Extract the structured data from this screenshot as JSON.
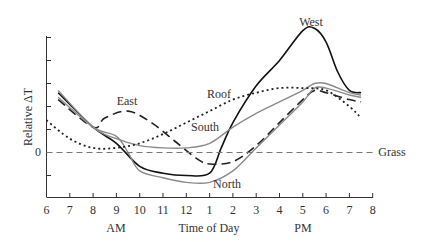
{
  "chart_data": {
    "type": "line",
    "title": "",
    "xlabel": "Time of Day",
    "ylabel": "Relative ΔT",
    "x_ticks": [
      "6",
      "7",
      "8",
      "9",
      "10",
      "11",
      "12",
      "1",
      "2",
      "3",
      "4",
      "5",
      "6",
      "7",
      "8"
    ],
    "x_period_labels": {
      "am": "AM",
      "pm": "PM"
    },
    "y_tick_label_zero": "0",
    "x_range_hours": [
      6,
      20
    ],
    "y_range": [
      -2,
      5
    ],
    "grid": false,
    "legend": "inline curve labels",
    "series": [
      {
        "name": "West",
        "style": "solid-black",
        "x": [
          6.5,
          8,
          9,
          10,
          11,
          12,
          13,
          13.5,
          14,
          15,
          16,
          17,
          17.5,
          18,
          18.5,
          19,
          19.5
        ],
        "y": [
          2.6,
          1.1,
          0.4,
          -0.6,
          -0.9,
          -1.0,
          -0.9,
          0.2,
          1.3,
          2.9,
          4.0,
          5.3,
          5.4,
          4.8,
          3.5,
          2.7,
          2.6
        ]
      },
      {
        "name": "East",
        "style": "long-dash-black",
        "x": [
          6.5,
          8,
          8.5,
          9.5,
          10.5,
          11.5,
          12.5,
          13,
          14,
          15,
          16,
          17,
          17.5,
          18,
          19,
          19.5
        ],
        "y": [
          2.3,
          1.1,
          1.5,
          1.8,
          1.3,
          0.5,
          -0.3,
          -0.5,
          -0.4,
          0.3,
          1.3,
          2.3,
          2.7,
          2.6,
          2.3,
          2.2
        ]
      },
      {
        "name": "South",
        "style": "solid-gray",
        "x": [
          6.5,
          8,
          9,
          10,
          11,
          12,
          13,
          14,
          15,
          16,
          17,
          17.5,
          18,
          19,
          19.5
        ],
        "y": [
          2.7,
          1.1,
          0.6,
          0.3,
          0.2,
          0.2,
          0.4,
          1.1,
          1.7,
          2.2,
          2.7,
          3.0,
          3.0,
          2.6,
          2.5
        ]
      },
      {
        "name": "North",
        "style": "solid-gray",
        "x": [
          6.5,
          8,
          9,
          9.5,
          10,
          11,
          12,
          13,
          14,
          15,
          16,
          17,
          17.5,
          18,
          19,
          19.5
        ],
        "y": [
          2.4,
          1.1,
          0.7,
          0.0,
          -0.8,
          -1.1,
          -1.3,
          -1.3,
          -0.8,
          0.2,
          1.2,
          2.2,
          2.8,
          2.8,
          2.5,
          2.4
        ]
      },
      {
        "name": "Roof",
        "style": "dotted-black",
        "x": [
          6,
          7,
          8,
          9,
          10,
          11,
          12,
          13,
          14,
          15,
          16,
          17,
          18,
          19,
          19.5
        ],
        "y": [
          1.4,
          0.6,
          0.2,
          0.2,
          0.4,
          0.8,
          1.3,
          1.8,
          2.3,
          2.6,
          2.8,
          2.8,
          2.7,
          2.0,
          1.5
        ]
      },
      {
        "name": "Grass",
        "style": "dashed-gray",
        "x": [
          6,
          20
        ],
        "y": [
          0,
          0
        ]
      }
    ]
  },
  "labels": {
    "west": "West",
    "east": "East",
    "roof": "Roof",
    "south": "South",
    "north": "North",
    "grass": "Grass",
    "zero": "0",
    "ylabel": "Relative ΔT",
    "xlabel": "Time of Day",
    "am": "AM",
    "pm": "PM",
    "ticks": [
      "6",
      "7",
      "8",
      "9",
      "10",
      "11",
      "12",
      "1",
      "2",
      "3",
      "4",
      "5",
      "6",
      "7",
      "8"
    ]
  }
}
